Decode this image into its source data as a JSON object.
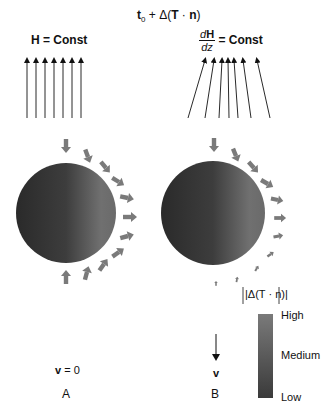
{
  "title": {
    "prefix": "t",
    "subscript": "0",
    "rest": " + Δ(",
    "T": "T",
    "dot": " · ",
    "n": "n",
    "close": ")"
  },
  "panel_a": {
    "field_label_H": "H",
    "field_label_eq": " = Const",
    "velocity_label_v": "v",
    "velocity_label_eq": " = 0",
    "panel_letter": "A"
  },
  "panel_b": {
    "frac_num_d": "d",
    "frac_num_H": "H",
    "frac_den": "dz",
    "field_label_eq": " = Const",
    "velocity_label_v": "v",
    "panel_letter": "B",
    "abs_label": "|Δ(T · n)|"
  },
  "colorbar": {
    "labels": [
      "High",
      "Medium",
      "Low"
    ],
    "top_color": "#7a7a7a",
    "bottom_color": "#3a3a3a"
  },
  "colors": {
    "sphere_light": "#8a8a8a",
    "sphere_dark": "#2a2a2a",
    "arrow": "#808080",
    "line": "#111111"
  }
}
